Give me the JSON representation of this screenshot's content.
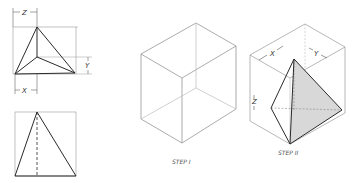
{
  "figure": {
    "type": "technical-drawing",
    "colors": {
      "line_dark": "#2a2a2a",
      "line_light": "#9a9a9a",
      "shade": "#d8d8d8",
      "background": "#ffffff"
    }
  },
  "views": {
    "top_view": {
      "dimensions": {
        "z": "Z",
        "x": "X",
        "y": "Y"
      }
    },
    "front_view": {}
  },
  "steps": [
    {
      "label": "STEP I",
      "description": "Isometric bounding box"
    },
    {
      "label": "STEP II",
      "description": "Pyramid constructed inside box",
      "dimensions": {
        "x": "X",
        "y": "Y",
        "z": "Z"
      }
    }
  ]
}
